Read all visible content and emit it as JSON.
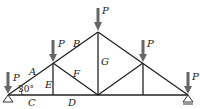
{
  "diagram": {
    "type": "roof truss",
    "angle_label": "30°",
    "load_label": "P",
    "member_labels": {
      "A": "A",
      "B": "B",
      "C": "C",
      "D": "D",
      "E": "E",
      "F": "F",
      "G": "G"
    },
    "colors": {
      "member": "#222222",
      "load_arrow": "#666666",
      "support": "#333333"
    }
  }
}
